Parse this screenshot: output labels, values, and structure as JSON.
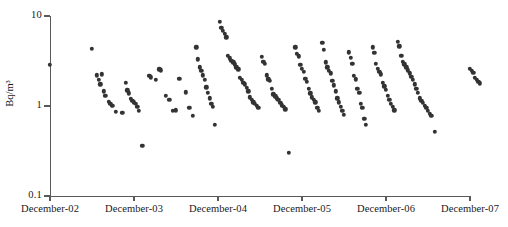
{
  "chart_data": {
    "type": "scatter",
    "title": "",
    "xlabel": "",
    "ylabel": "Bq/m³",
    "yscale": "log",
    "ylim": [
      0.1,
      10
    ],
    "ytick_labels": [
      "10",
      "1",
      "0.1"
    ],
    "ytick_values": [
      10,
      1,
      0.1
    ],
    "xtick_labels": [
      "December-02",
      "December-03",
      "December-04",
      "December-05",
      "December-06",
      "December-07"
    ],
    "grid": false,
    "legend": null,
    "marker_color": "#333333",
    "axis_color": "#595959",
    "series": [
      {
        "name": "Radon activity concentration",
        "points": [
          [
            2.0,
            2.85
          ],
          [
            2.5,
            4.3
          ],
          [
            2.56,
            2.2
          ],
          [
            2.58,
            1.95
          ],
          [
            2.6,
            1.75
          ],
          [
            2.62,
            2.25
          ],
          [
            2.64,
            1.45
          ],
          [
            2.66,
            1.3
          ],
          [
            2.7,
            1.12
          ],
          [
            2.72,
            1.05
          ],
          [
            2.74,
            1.0
          ],
          [
            2.78,
            0.86
          ],
          [
            2.86,
            0.84
          ],
          [
            2.9,
            1.8
          ],
          [
            2.92,
            1.5
          ],
          [
            2.94,
            1.38
          ],
          [
            2.96,
            1.2
          ],
          [
            2.98,
            1.15
          ],
          [
            3.0,
            1.1
          ],
          [
            3.02,
            1.05
          ],
          [
            3.04,
            0.98
          ],
          [
            3.06,
            0.88
          ],
          [
            3.1,
            0.36
          ],
          [
            3.18,
            2.15
          ],
          [
            3.2,
            2.08
          ],
          [
            3.26,
            1.95
          ],
          [
            3.3,
            2.55
          ],
          [
            3.32,
            2.5
          ],
          [
            3.38,
            1.3
          ],
          [
            3.42,
            1.18
          ],
          [
            3.46,
            0.88
          ],
          [
            3.5,
            0.9
          ],
          [
            3.54,
            2.0
          ],
          [
            3.62,
            1.42
          ],
          [
            3.66,
            0.95
          ],
          [
            3.7,
            0.78
          ],
          [
            3.74,
            4.5
          ],
          [
            3.76,
            3.3
          ],
          [
            3.78,
            2.7
          ],
          [
            3.8,
            2.45
          ],
          [
            3.82,
            2.2
          ],
          [
            3.84,
            1.95
          ],
          [
            3.86,
            1.62
          ],
          [
            3.88,
            1.4
          ],
          [
            3.9,
            1.22
          ],
          [
            3.92,
            1.05
          ],
          [
            3.94,
            0.98
          ],
          [
            3.96,
            0.62
          ],
          [
            4.02,
            8.6
          ],
          [
            4.04,
            7.4
          ],
          [
            4.06,
            6.9
          ],
          [
            4.08,
            6.3
          ],
          [
            4.1,
            5.8
          ],
          [
            4.12,
            3.6
          ],
          [
            4.14,
            3.4
          ],
          [
            4.16,
            3.2
          ],
          [
            4.18,
            3.05
          ],
          [
            4.2,
            2.9
          ],
          [
            4.22,
            2.7
          ],
          [
            4.24,
            2.55
          ],
          [
            4.26,
            2.05
          ],
          [
            4.28,
            1.95
          ],
          [
            4.3,
            1.82
          ],
          [
            4.32,
            1.75
          ],
          [
            4.34,
            1.6
          ],
          [
            4.36,
            1.45
          ],
          [
            4.38,
            1.25
          ],
          [
            4.4,
            1.18
          ],
          [
            4.42,
            1.1
          ],
          [
            4.44,
            1.05
          ],
          [
            4.46,
            1.0
          ],
          [
            4.48,
            0.95
          ],
          [
            4.52,
            3.5
          ],
          [
            4.54,
            3.1
          ],
          [
            4.56,
            2.95
          ],
          [
            4.58,
            2.2
          ],
          [
            4.6,
            1.98
          ],
          [
            4.62,
            1.9
          ],
          [
            4.64,
            1.55
          ],
          [
            4.66,
            1.35
          ],
          [
            4.68,
            1.28
          ],
          [
            4.7,
            1.22
          ],
          [
            4.72,
            1.18
          ],
          [
            4.74,
            1.08
          ],
          [
            4.76,
            1.02
          ],
          [
            4.78,
            0.98
          ],
          [
            4.8,
            0.92
          ],
          [
            4.84,
            0.3
          ],
          [
            4.92,
            4.5
          ],
          [
            4.94,
            3.8
          ],
          [
            4.96,
            3.55
          ],
          [
            4.98,
            2.85
          ],
          [
            5.0,
            2.6
          ],
          [
            5.02,
            2.4
          ],
          [
            5.04,
            2.0
          ],
          [
            5.06,
            1.85
          ],
          [
            5.08,
            1.55
          ],
          [
            5.1,
            1.38
          ],
          [
            5.12,
            1.25
          ],
          [
            5.14,
            1.18
          ],
          [
            5.16,
            1.1
          ],
          [
            5.18,
            0.95
          ],
          [
            5.2,
            0.88
          ],
          [
            5.24,
            5.0
          ],
          [
            5.26,
            4.2
          ],
          [
            5.28,
            3.05
          ],
          [
            5.3,
            2.7
          ],
          [
            5.32,
            2.45
          ],
          [
            5.34,
            2.3
          ],
          [
            5.36,
            1.92
          ],
          [
            5.38,
            1.7
          ],
          [
            5.4,
            1.45
          ],
          [
            5.42,
            1.22
          ],
          [
            5.44,
            1.1
          ],
          [
            5.46,
            0.98
          ],
          [
            5.48,
            0.88
          ],
          [
            5.5,
            0.8
          ],
          [
            5.56,
            3.95
          ],
          [
            5.58,
            3.45
          ],
          [
            5.6,
            2.95
          ],
          [
            5.62,
            2.15
          ],
          [
            5.64,
            1.98
          ],
          [
            5.66,
            1.55
          ],
          [
            5.68,
            1.4
          ],
          [
            5.7,
            1.05
          ],
          [
            5.72,
            0.95
          ],
          [
            5.74,
            0.72
          ],
          [
            5.76,
            0.62
          ],
          [
            5.84,
            4.5
          ],
          [
            5.86,
            3.9
          ],
          [
            5.88,
            2.95
          ],
          [
            5.9,
            2.6
          ],
          [
            5.92,
            2.4
          ],
          [
            5.94,
            2.25
          ],
          [
            5.96,
            1.8
          ],
          [
            5.98,
            1.65
          ],
          [
            6.0,
            1.52
          ],
          [
            6.02,
            1.3
          ],
          [
            6.04,
            1.18
          ],
          [
            6.06,
            1.05
          ],
          [
            6.08,
            0.98
          ],
          [
            6.1,
            0.9
          ],
          [
            6.14,
            5.2
          ],
          [
            6.16,
            4.6
          ],
          [
            6.18,
            3.6
          ],
          [
            6.2,
            3.1
          ],
          [
            6.22,
            2.9
          ],
          [
            6.24,
            2.7
          ],
          [
            6.26,
            2.5
          ],
          [
            6.28,
            2.3
          ],
          [
            6.3,
            2.1
          ],
          [
            6.32,
            1.95
          ],
          [
            6.34,
            1.75
          ],
          [
            6.36,
            1.55
          ],
          [
            6.38,
            1.4
          ],
          [
            6.4,
            1.22
          ],
          [
            6.42,
            1.15
          ],
          [
            6.44,
            1.08
          ],
          [
            6.46,
            1.0
          ],
          [
            6.48,
            0.95
          ],
          [
            6.5,
            0.88
          ],
          [
            6.52,
            0.82
          ],
          [
            6.54,
            0.78
          ],
          [
            6.58,
            0.52
          ],
          [
            7.0,
            2.6
          ],
          [
            7.02,
            2.45
          ],
          [
            7.04,
            2.35
          ],
          [
            7.06,
            2.05
          ],
          [
            7.08,
            1.95
          ],
          [
            7.1,
            1.85
          ],
          [
            7.12,
            1.78
          ]
        ]
      }
    ]
  },
  "axis": {
    "y_ticks": [
      {
        "label": "10",
        "value": 10
      },
      {
        "label": "1",
        "value": 1
      },
      {
        "label": "0.1",
        "value": 0.1
      }
    ],
    "x_ticks": [
      {
        "label": "December-02",
        "value": 2
      },
      {
        "label": "December-03",
        "value": 3
      },
      {
        "label": "December-04",
        "value": 4
      },
      {
        "label": "December-05",
        "value": 5
      },
      {
        "label": "December-06",
        "value": 6
      },
      {
        "label": "December-07",
        "value": 7
      }
    ],
    "y_title": "Bq/m³"
  }
}
